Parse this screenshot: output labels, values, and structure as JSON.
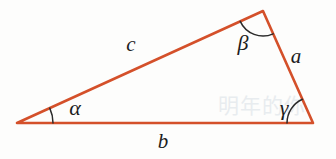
{
  "figure": {
    "type": "geometry-diagram",
    "width": 336,
    "height": 159,
    "background_color": "#fdfdfc",
    "stroke_color": "#d4502a",
    "stroke_width": 2.6,
    "arc_color": "#2b2b2b",
    "arc_width": 1.5,
    "label_color": "#1c1c1c"
  },
  "vertices": {
    "left": {
      "name": "alpha-vertex",
      "x": 17,
      "y": 123
    },
    "top": {
      "name": "beta-vertex",
      "x": 263,
      "y": 11
    },
    "right": {
      "name": "gamma-vertex",
      "x": 313,
      "y": 123
    }
  },
  "sides": [
    {
      "id": "a",
      "label": "a",
      "label_x": 296,
      "label_y": 56,
      "from": "top",
      "to": "right"
    },
    {
      "id": "b",
      "label": "b",
      "label_x": 163,
      "label_y": 141,
      "from": "left",
      "to": "right"
    },
    {
      "id": "c",
      "label": "c",
      "label_x": 131,
      "label_y": 44,
      "from": "left",
      "to": "top"
    }
  ],
  "angles": [
    {
      "id": "alpha",
      "label": "α",
      "label_x": 75,
      "label_y": 108,
      "vertex": "left",
      "arc_radius": 36
    },
    {
      "id": "beta",
      "label": "β",
      "label_x": 243,
      "label_y": 43,
      "vertex": "top",
      "arc_radius": 25
    },
    {
      "id": "gamma",
      "label": "γ",
      "label_x": 284,
      "label_y": 108,
      "vertex": "right",
      "arc_radius": 26
    }
  ],
  "watermark": {
    "text": "明年的你",
    "x": 262,
    "y": 104
  }
}
